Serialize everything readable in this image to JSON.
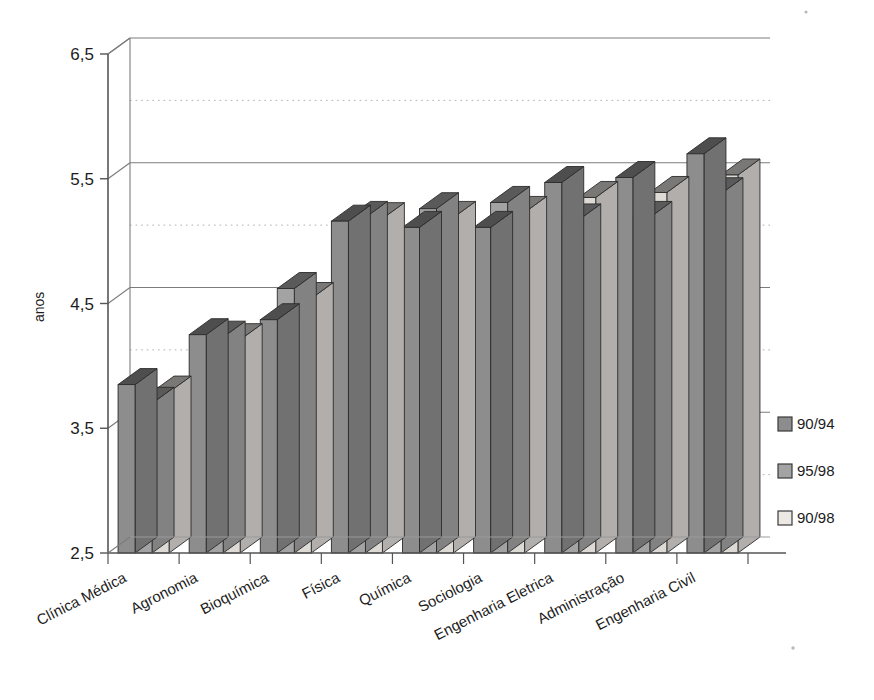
{
  "chart_data": {
    "type": "bar",
    "title": "",
    "xlabel": "",
    "ylabel": "anos",
    "ylim": [
      2.5,
      6.5
    ],
    "ytick_labels": [
      "2,5",
      "3,5",
      "4,5",
      "5,5",
      "6,5"
    ],
    "ytick_values": [
      2.5,
      3.5,
      4.5,
      5.5,
      6.5
    ],
    "minor_gridlines": [
      3.0,
      4.0,
      5.0,
      6.0
    ],
    "grid": "major solid, minor dotted",
    "legend_position": "right",
    "style": "3d-bars-grayscale",
    "categories": [
      "Clínica Médica",
      "Agronomia",
      "Bioquímica",
      "Física",
      "Química",
      "Sociologia",
      "Engenharia Eletrica",
      "Administração",
      "Engenharia Civil"
    ],
    "series": [
      {
        "name": "90/94",
        "color": "#8d8d8d",
        "values": [
          3.85,
          4.25,
          4.37,
          5.16,
          5.11,
          5.11,
          5.47,
          5.51,
          5.7
        ]
      },
      {
        "name": "95/98",
        "color": "#a3a3a3",
        "values": [
          3.7,
          4.23,
          4.62,
          5.19,
          5.26,
          5.31,
          5.17,
          5.19,
          5.38
        ]
      },
      {
        "name": "90/98",
        "color": "#dddad6",
        "values": [
          3.79,
          4.21,
          4.54,
          5.18,
          5.19,
          5.23,
          5.35,
          5.39,
          5.53
        ]
      }
    ]
  },
  "legend": {
    "items": [
      {
        "label": "90/94",
        "color": "#8d8d8d"
      },
      {
        "label": "95/98",
        "color": "#a3a3a3"
      },
      {
        "label": "90/98",
        "color": "#ece9e5"
      }
    ]
  },
  "axis": {
    "y_title": "anos"
  }
}
